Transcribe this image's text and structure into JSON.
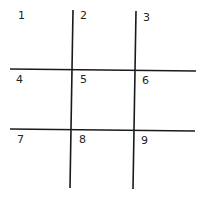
{
  "grid": {
    "rows": 3,
    "cols": 3,
    "line_color": "#1a1a1a",
    "cells": [
      "1",
      "2",
      "3",
      "4",
      "5",
      "6",
      "7",
      "8",
      "9"
    ]
  }
}
